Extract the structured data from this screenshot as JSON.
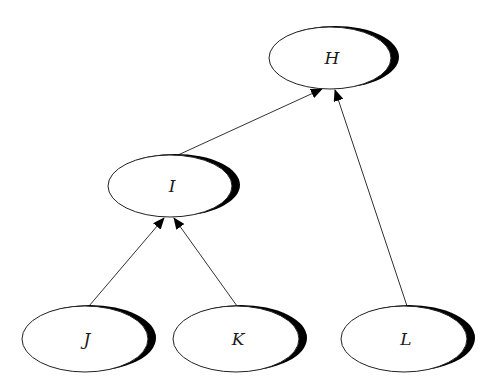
{
  "diagram": {
    "type": "tree",
    "direction": "bottom-to-top",
    "background": "#ffffff",
    "nodes": [
      {
        "id": "H",
        "label": "H",
        "cx": 330,
        "cy": 58,
        "rx": 61,
        "ry": 31
      },
      {
        "id": "I",
        "label": "I",
        "cx": 170,
        "cy": 186,
        "rx": 62,
        "ry": 31
      },
      {
        "id": "J",
        "label": "J",
        "cx": 85,
        "cy": 339,
        "rx": 63,
        "ry": 33
      },
      {
        "id": "K",
        "label": "K",
        "cx": 236,
        "cy": 339,
        "rx": 63,
        "ry": 33
      },
      {
        "id": "L",
        "label": "L",
        "cx": 404,
        "cy": 339,
        "rx": 63,
        "ry": 33
      }
    ],
    "edges": [
      {
        "from": "I",
        "to": "H",
        "x1": 178,
        "y1": 155,
        "x2": 322,
        "y2": 89
      },
      {
        "from": "L",
        "to": "H",
        "x1": 407,
        "y1": 306,
        "x2": 335,
        "y2": 90
      },
      {
        "from": "J",
        "to": "I",
        "x1": 89,
        "y1": 306,
        "x2": 164,
        "y2": 218
      },
      {
        "from": "K",
        "to": "I",
        "x1": 237,
        "y1": 306,
        "x2": 174,
        "y2": 218
      }
    ]
  }
}
